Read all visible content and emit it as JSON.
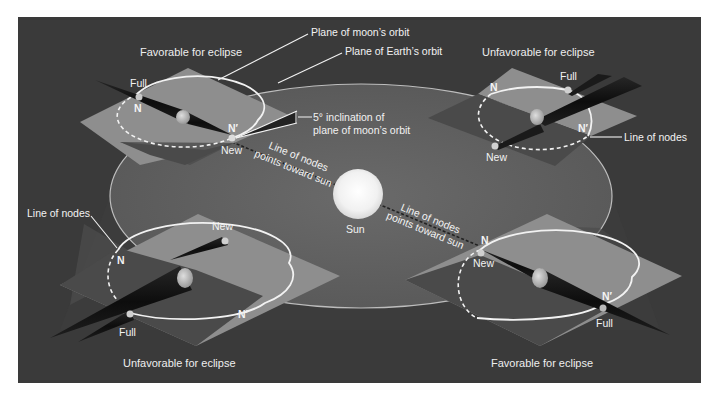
{
  "figure": {
    "colors": {
      "page_background": "#ffffff",
      "panel_background": "#3a3a3a",
      "earth_orbit_plane": "#5c5c5c",
      "moon_orbit_plane": "#8e8e8e",
      "moon_orbit_plane_shadowed": "#4a4a4a",
      "orbit_line": "#f2f2f2",
      "sun": "#f7f7f7",
      "shadow_cone": "#111111",
      "label_text": "#f2f2f2"
    },
    "callouts": {
      "plane_of_moons_orbit": "Plane of moon’s orbit",
      "plane_of_earths_orbit": "Plane of Earth’s orbit",
      "inclination_line1": "5° inclination of",
      "inclination_line2": "plane of moon’s orbit",
      "line_of_nodes_right": "Line of nodes",
      "line_of_nodes_left": "Line of nodes"
    },
    "center": {
      "sun_label": "Sun",
      "nodes_note_upper_line1": "Line of nodes",
      "nodes_note_upper_line2": "points toward sun",
      "nodes_note_lower_line1": "Line of nodes",
      "nodes_note_lower_line2": "points toward sun"
    },
    "panels": [
      {
        "position": "top-left",
        "caption": "Favorable for eclipse",
        "labels": {
          "full": "Full",
          "new": "New",
          "node": "N",
          "node_prime": "N′"
        }
      },
      {
        "position": "top-right",
        "caption": "Unfavorable for eclipse",
        "labels": {
          "full": "Full",
          "new": "New",
          "node": "N",
          "node_prime": "N′"
        }
      },
      {
        "position": "bottom-left",
        "caption": "Unfavorable for eclipse",
        "labels": {
          "full": "Full",
          "new": "New",
          "node": "N",
          "node_prime": "N′"
        }
      },
      {
        "position": "bottom-right",
        "caption": "Favorable for eclipse",
        "labels": {
          "full": "Full",
          "new": "New",
          "node": "N",
          "node_prime": "N′"
        }
      }
    ]
  }
}
